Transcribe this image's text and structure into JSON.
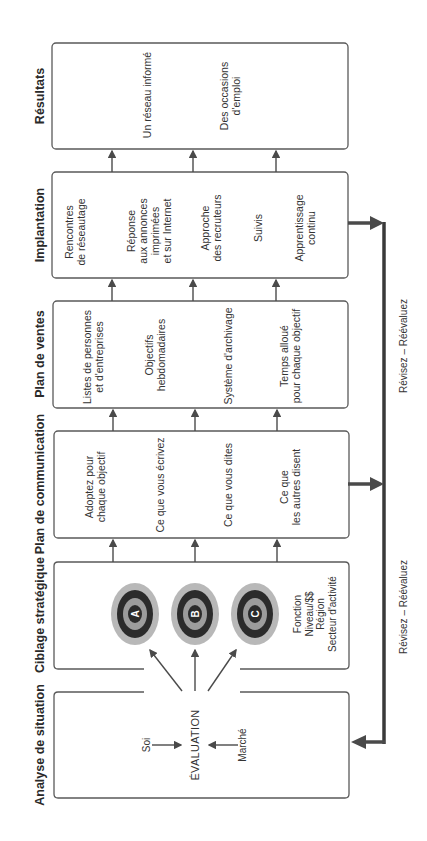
{
  "colors": {
    "box_border": "#555555",
    "arrow": "#4a4a4a",
    "feedback_line": "#3a3a3a",
    "target_outer": "#b5b5b5",
    "target_ring": "#2b2b2b",
    "target_mid": "#9a9a9a",
    "target_center": "#2b2b2b"
  },
  "stages": [
    {
      "id": "resultats",
      "heading": "Résultats",
      "items": [
        "Un réseau informé",
        "Des occasions\nd'emploi"
      ]
    },
    {
      "id": "implantation",
      "heading": "Implantation",
      "items": [
        "Rencontres\nde réseautage",
        "Réponse\naux annonces\nimprimées\net sur Internet",
        "Approche\ndes recruteurs",
        "Suivis",
        "Apprentissage\ncontinu"
      ]
    },
    {
      "id": "plan-de-ventes",
      "heading": "Plan de ventes",
      "items": [
        "Listes de personnes\net d'entreprises",
        "Objectifs\nhebdomadaires",
        "Système d'archivage",
        "Temps alloué\npour chaque objectif"
      ]
    },
    {
      "id": "plan-de-communication",
      "heading": "Plan de communication",
      "items": [
        "Adoptez pour\nchaque objectif",
        "Ce que vous écrivez",
        "Ce que vous dites",
        "Ce que\nles autres disent"
      ]
    },
    {
      "id": "ciblage-strategique",
      "heading": "Ciblage stratégique",
      "targets": [
        "A",
        "B",
        "C"
      ],
      "criteria": "Fonction\nNiveau/$$\nRégion\nSecteur d'activité"
    },
    {
      "id": "analyse-de-situation",
      "heading": "Analyse de situation",
      "evaluation": "ÉVALUATION",
      "inputs": [
        "Soi",
        "Marché"
      ]
    }
  ],
  "feedback": {
    "labels": [
      "Révisez – Réévaluez",
      "Révisez – Réévaluez"
    ]
  }
}
